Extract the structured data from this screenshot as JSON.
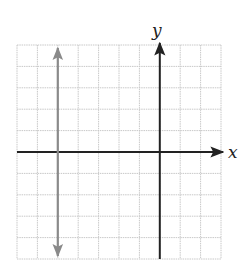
{
  "chart_data": {
    "type": "line",
    "title": "",
    "xlabel": "x",
    "ylabel": "y",
    "xlim": [
      -7,
      3
    ],
    "ylim": [
      -5,
      5
    ],
    "grid": true,
    "grid_step": 1,
    "series": [
      {
        "name": "vertical line",
        "equation": "x = -5",
        "x": [
          -5,
          -5
        ],
        "y": [
          -5,
          5
        ],
        "color": "#8a8a8a",
        "arrows": "both"
      }
    ]
  },
  "labels": {
    "x_axis": "x",
    "y_axis": "y"
  },
  "colors": {
    "grid": "#c8c8c8",
    "axes": "#222222",
    "line": "#8a8a8a"
  }
}
